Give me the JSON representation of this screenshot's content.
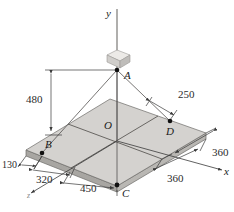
{
  "figure": {
    "kind": "engineering-statics-diagram",
    "colors": {
      "plate_top": "#d2d0cd",
      "plate_top_light": "#dedcd8",
      "plate_edge": "#b4b2ae",
      "plate_side": "#a8a6a2",
      "block_light": "#e8e6e3",
      "block_shade": "#c6c4c0",
      "line": "#3a3a3a",
      "cable": "#5a5a5a",
      "text": "#1a1a1a"
    }
  },
  "axes": [
    {
      "name": "y-axis",
      "label": "y"
    },
    {
      "name": "x-axis",
      "label": "x"
    },
    {
      "name": "z-axis",
      "label": "z"
    }
  ],
  "points": [
    {
      "name": "point-a",
      "label": "A",
      "dot": true
    },
    {
      "name": "point-b",
      "label": "B",
      "dot": true
    },
    {
      "name": "point-c",
      "label": "C",
      "dot": true
    },
    {
      "name": "point-d",
      "label": "D",
      "dot": true
    },
    {
      "name": "origin-o",
      "label": "O",
      "dot": false
    }
  ],
  "dimensions": [
    {
      "name": "height-a-above-plate",
      "label": "480"
    },
    {
      "name": "d-offset-from-edge",
      "label": "250"
    },
    {
      "name": "b-offset-z",
      "label": "130"
    },
    {
      "name": "b-offset-x",
      "label": "320"
    },
    {
      "name": "c-offset-x",
      "label": "450"
    },
    {
      "name": "plate-half-depth",
      "label": "360"
    },
    {
      "name": "plate-half-width",
      "label": "360"
    }
  ]
}
